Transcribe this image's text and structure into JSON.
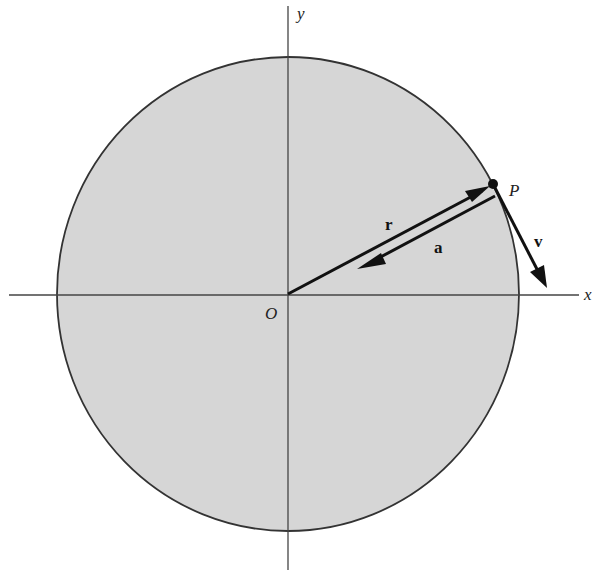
{
  "figure": {
    "type": "uniform circular motion diagram",
    "colors": {
      "disk_fill": "#d6d6d6",
      "disk_stroke": "#333333",
      "axis": "#444444",
      "vector": "#111111",
      "background": "#ffffff"
    },
    "labels": {
      "x_axis": "x",
      "y_axis": "y",
      "origin": "O",
      "point": "P",
      "position_vector": "r",
      "velocity_vector": "v",
      "acceleration_vector": "a"
    }
  }
}
